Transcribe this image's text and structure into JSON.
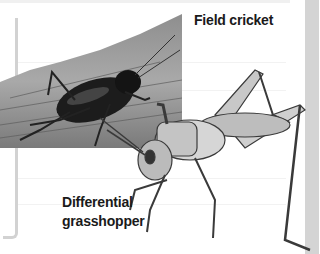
{
  "labels": {
    "field_cricket": "Field cricket",
    "grasshopper_line1": "Differential",
    "grasshopper_line2": "grasshopper"
  },
  "images": {
    "cricket_photo": "field-cricket-on-bark",
    "grasshopper_photo": "differential-grasshopper"
  },
  "colors": {
    "background": "#ffffff",
    "label_text": "#1a1a1a",
    "bracket": "#d2d2d2",
    "side_strip": "#d4d4d4"
  }
}
